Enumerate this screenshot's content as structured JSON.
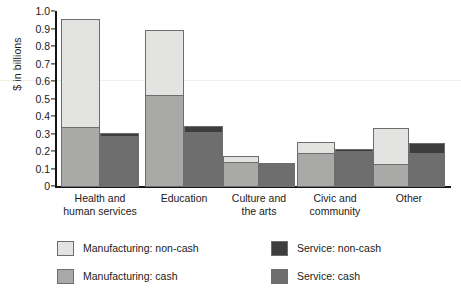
{
  "chart_data": {
    "type": "bar",
    "title": "",
    "subtitle": "",
    "xlabel": "",
    "ylabel": "$ in billions",
    "stacked": true,
    "grouped": true,
    "grid": false,
    "legend_position": "bottom-left",
    "ylim": [
      0,
      1.0
    ],
    "yticks": [
      "0",
      "0.1",
      "0.2",
      "0.3",
      "0.4",
      "0.5",
      "0.6",
      "0.7",
      "0.8",
      "0.9",
      "1.0"
    ],
    "ytick_values": [
      0,
      0.1,
      0.2,
      0.3,
      0.4,
      0.5,
      0.6,
      0.7,
      0.8,
      0.9,
      1.0
    ],
    "categories": [
      "Health and\nhuman services",
      "Education",
      "Culture and\nthe arts",
      "Civic and\ncommunity",
      "Other"
    ],
    "series": [
      {
        "name": "Manufacturing: cash",
        "values": [
          0.35,
          0.53,
          0.15,
          0.2,
          0.14
        ]
      },
      {
        "name": "Manufacturing: non-cash",
        "values": [
          0.61,
          0.37,
          0.03,
          0.06,
          0.2
        ]
      },
      {
        "name": "Service: cash",
        "values": [
          0.3,
          0.32,
          0.14,
          0.21,
          0.2
        ]
      },
      {
        "name": "Service: non-cash",
        "values": [
          0.01,
          0.03,
          0.0,
          0.01,
          0.05
        ]
      }
    ],
    "bar_totals": {
      "manufacturing": [
        0.96,
        0.9,
        0.18,
        0.26,
        0.34
      ],
      "service": [
        0.31,
        0.35,
        0.14,
        0.22,
        0.25
      ]
    },
    "colors": {
      "manufacturing_noncash": "#e3e3e1",
      "manufacturing_cash": "#a9a9a7",
      "service_cash": "#6e6e6e",
      "service_noncash": "#3d3d3d",
      "border": "#6d6d6d",
      "axis": "#141414",
      "text": "#1a1a1a"
    }
  },
  "legend": {
    "items": [
      {
        "label": "Manufacturing: non-cash",
        "color": "#e3e3e1"
      },
      {
        "label": "Service: non-cash",
        "color": "#3d3d3d"
      },
      {
        "label": "Manufacturing: cash",
        "color": "#a9a9a7"
      },
      {
        "label": "Service: cash",
        "color": "#6e6e6e"
      }
    ]
  }
}
